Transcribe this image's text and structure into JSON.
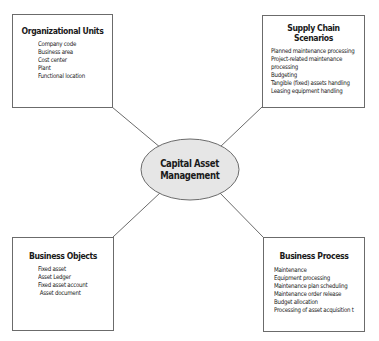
{
  "diagram": {
    "center": {
      "line1": "Capital Asset",
      "line2": "Management",
      "fill": "#e6e6e6",
      "stroke": "#6b6b6b"
    },
    "boxes": {
      "organizational_units": {
        "title": "Organizational Units",
        "items": [
          "Company code",
          "Business area",
          "Cost center",
          "Plant",
          "Functional location"
        ]
      },
      "supply_chain_scenarios": {
        "title_line1": "Supply Chain",
        "title_line2": "Scenarios",
        "items": [
          "Planned maintenance processing",
          "Project-related maintenance",
          "processing",
          "Budgeting",
          "Tangible (fixed) assets handling",
          "Leasing equipment handling"
        ]
      },
      "business_objects": {
        "title": "Business Objects",
        "items": [
          "Fixed asset",
          "Asset Ledger",
          "Fixed asset account",
          " Asset document"
        ]
      },
      "business_process": {
        "title": "Business Process",
        "items": [
          "Maintenance",
          "Equipment processing",
          "Maintenance plan scheduling",
          "Maintenance order release",
          "Budget allocation",
          "Processing of asset acquisition t"
        ]
      }
    },
    "colors": {
      "line": "#6b6b6b",
      "border": "#6b6b6b",
      "text": "#1a1a1a"
    }
  }
}
